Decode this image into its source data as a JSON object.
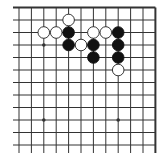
{
  "board": {
    "region": "upper-right corner",
    "cols": 12,
    "rows": 12,
    "origin_x": 19,
    "origin_y": 7.5,
    "spacing_x": 12.4,
    "spacing_y": 12.5,
    "edges": {
      "top": true,
      "right": true,
      "left": false,
      "bottom": false
    },
    "colors": {
      "line": "#333333",
      "black_stone": "#111111",
      "white_stone": "#ffffff",
      "white_outline": "#222222",
      "background": "#ffffff"
    },
    "star_points": [
      {
        "col": 2,
        "row": 3
      },
      {
        "col": 2,
        "row": 9
      },
      {
        "col": 8,
        "row": 9
      }
    ],
    "stones": [
      {
        "color": "white",
        "col": 4,
        "row": 1
      },
      {
        "color": "white",
        "col": 2,
        "row": 2
      },
      {
        "color": "white",
        "col": 3,
        "row": 2
      },
      {
        "color": "black",
        "col": 4,
        "row": 2
      },
      {
        "color": "white",
        "col": 6,
        "row": 2
      },
      {
        "color": "white",
        "col": 7,
        "row": 2
      },
      {
        "color": "black",
        "col": 8,
        "row": 2
      },
      {
        "color": "black",
        "col": 4,
        "row": 3
      },
      {
        "color": "white",
        "col": 5,
        "row": 3
      },
      {
        "color": "black",
        "col": 6,
        "row": 3
      },
      {
        "color": "black",
        "col": 8,
        "row": 3
      },
      {
        "color": "black",
        "col": 6,
        "row": 4
      },
      {
        "color": "black",
        "col": 8,
        "row": 4
      },
      {
        "color": "white",
        "col": 8,
        "row": 5
      }
    ]
  }
}
